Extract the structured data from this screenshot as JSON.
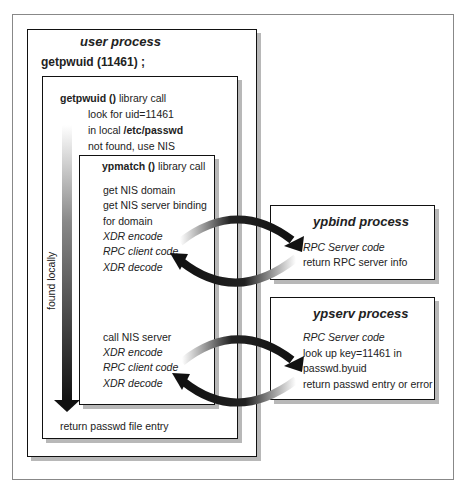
{
  "user_process": {
    "title": "user process",
    "call": "getpwuid (11461) ;",
    "library": {
      "title_bold": "getpwuid ()",
      "title_rest": " library call",
      "lines": [
        "look for uid=11461",
        "in local ",
        "not found, use NIS"
      ],
      "passwd_path": "/etc/passwd",
      "found_locally": "found locally",
      "return": "return passwd file entry",
      "ypmatch": {
        "title_bold": "ypmatch ()",
        "title_rest": " library call",
        "lines_a": [
          "get NIS domain",
          "get NIS server binding",
          "for domain"
        ],
        "lines_a_italic": [
          "XDR encode",
          "RPC client code",
          "XDR decode"
        ],
        "line_b": "call NIS server",
        "lines_b_italic": [
          "XDR encode",
          "RPC client code",
          "XDR decode"
        ]
      }
    }
  },
  "ypbind": {
    "title": "ypbind process",
    "line_italic": "RPC Server code",
    "line": "return RPC server info"
  },
  "ypserv": {
    "title": "ypserv process",
    "line_italic": "RPC Server code",
    "lines": [
      "look up key=11461 in",
      "passwd.byuid",
      "return passwd entry or error"
    ]
  }
}
